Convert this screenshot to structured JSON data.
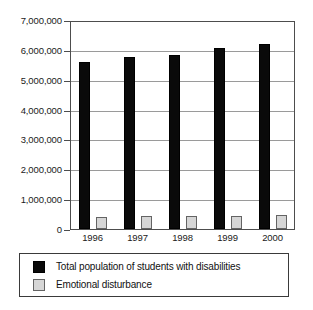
{
  "chart_data": {
    "type": "bar",
    "title": "",
    "xlabel": "",
    "ylabel": "",
    "categories": [
      "1996",
      "1997",
      "1998",
      "1999",
      "2000"
    ],
    "series": [
      {
        "name": "Total population of students with disabilities",
        "color": "#0a0a0a",
        "values": [
          5600000,
          5750000,
          5820000,
          6050000,
          6200000
        ]
      },
      {
        "name": "Emotional disturbance",
        "color": "#d6d6d6",
        "values": [
          410000,
          420000,
          420000,
          440000,
          470000
        ]
      }
    ],
    "ylim": [
      0,
      7000000
    ],
    "ytick_values": [
      0,
      1000000,
      2000000,
      3000000,
      4000000,
      5000000,
      6000000,
      7000000
    ],
    "ytick_labels": [
      "0",
      "1,000,000",
      "2,000,000",
      "3,000,000",
      "4,000,000",
      "5,000,000",
      "6,000,000",
      "7,000,000"
    ],
    "grid": true,
    "legend_position": "below"
  },
  "legend": {
    "entries": [
      {
        "label": "Total population of students with disabilities",
        "swatch": "black-square-swatch"
      },
      {
        "label": "Emotional disturbance",
        "swatch": "gray-square-swatch"
      }
    ]
  }
}
